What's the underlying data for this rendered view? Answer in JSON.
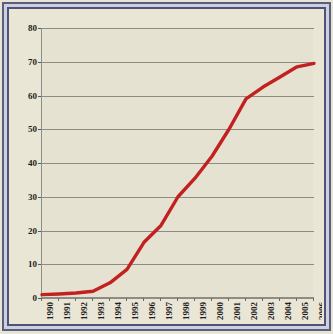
{
  "chart_data": {
    "type": "line",
    "title": "",
    "xlabel": "",
    "ylabel": "",
    "x": [
      1990,
      1991,
      1992,
      1993,
      1994,
      1995,
      1996,
      1997,
      1998,
      1999,
      2000,
      2001,
      2002,
      2003,
      2004,
      2005,
      2006
    ],
    "categories": [
      "1990",
      "1991",
      "1992",
      "1993",
      "1994",
      "1995",
      "1996",
      "1997",
      "1998",
      "1999",
      "2000",
      "2001",
      "2002",
      "2003",
      "2004",
      "2005",
      "2006"
    ],
    "values": [
      1,
      1.2,
      1.5,
      2,
      4.5,
      8.5,
      16.5,
      21.5,
      30,
      35.5,
      42,
      50,
      59,
      62.5,
      65.5,
      68.5,
      69.5
    ],
    "series": [
      {
        "name": "series-1",
        "color": "#c22121",
        "values": [
          1,
          1.2,
          1.5,
          2,
          4.5,
          8.5,
          16.5,
          21.5,
          30,
          35.5,
          42,
          50,
          59,
          62.5,
          65.5,
          68.5,
          69.5
        ]
      }
    ],
    "ylim": [
      0,
      80
    ],
    "yticks": [
      0,
      10,
      20,
      30,
      40,
      50,
      60,
      70,
      80
    ],
    "ytick_labels": [
      "0",
      "10",
      "20",
      "30",
      "40",
      "50",
      "60",
      "70",
      "80"
    ],
    "xlim": [
      1990,
      2006
    ],
    "grid": true,
    "grid_axis": "y",
    "legend": false,
    "legend_position": "none"
  },
  "style": {
    "line_color": "#c22121",
    "plot_background": "#e6e2d2",
    "page_background": "#e9e5d5",
    "grid_color": "#8d8d85",
    "frame_color": "#4e5378",
    "frame_inner_color": "#cdd0de",
    "tick_label_color": "#1d1d1d"
  }
}
